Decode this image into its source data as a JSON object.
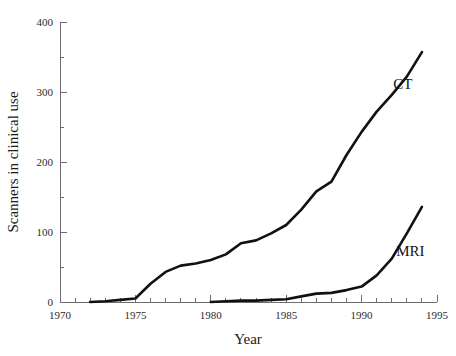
{
  "chart_data": {
    "type": "line",
    "title": "",
    "xlabel": "Year",
    "ylabel": "Scanners in clinical use",
    "xlim": [
      1970,
      1995
    ],
    "ylim": [
      0,
      400
    ],
    "grid": false,
    "legend_position": "inline-annotation",
    "x_ticks": [
      1970,
      1975,
      1980,
      1985,
      1990,
      1995
    ],
    "x_tick_labels": [
      "1970",
      "1975",
      "1980",
      "1985",
      "1990",
      "1995"
    ],
    "x_minor_tick_step": 1,
    "y_ticks": [
      0,
      100,
      200,
      300,
      400
    ],
    "y_tick_labels": [
      "0",
      "100",
      "200",
      "300",
      "400"
    ],
    "y_minor_tick_step": 50,
    "series": [
      {
        "name": "CT",
        "label": "CT",
        "label_x": 1992.1,
        "label_y": 305,
        "color": "#111111",
        "x": [
          1972,
          1973,
          1974,
          1975,
          1976,
          1977,
          1978,
          1979,
          1980,
          1981,
          1982,
          1983,
          1984,
          1985,
          1986,
          1987,
          1988,
          1989,
          1990,
          1991,
          1992,
          1993,
          1994
        ],
        "y": [
          0,
          1,
          3,
          5,
          26,
          43,
          52,
          55,
          60,
          68,
          84,
          88,
          98,
          110,
          132,
          158,
          172,
          210,
          243,
          272,
          296,
          322,
          357
        ]
      },
      {
        "name": "MRI",
        "label": "MRI",
        "label_x": 1992.3,
        "label_y": 66,
        "color": "#111111",
        "x": [
          1980,
          1981,
          1982,
          1983,
          1984,
          1985,
          1986,
          1987,
          1988,
          1989,
          1990,
          1991,
          1992,
          1993,
          1994
        ],
        "y": [
          0,
          1,
          2,
          2,
          3,
          4,
          8,
          12,
          13,
          17,
          22,
          38,
          62,
          98,
          136
        ]
      }
    ]
  }
}
